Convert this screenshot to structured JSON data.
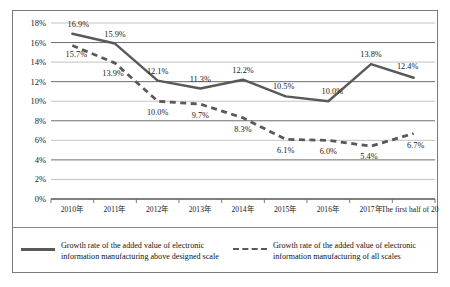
{
  "chart_data": {
    "type": "line",
    "title": "",
    "subtitle": "",
    "xlabel": "",
    "ylabel": "",
    "ylim": [
      0,
      18
    ],
    "ytick_labels": [
      "0%",
      "2%",
      "4%",
      "6%",
      "8%",
      "10%",
      "12%",
      "14%",
      "16%",
      "18%"
    ],
    "ytick_values": [
      0,
      2,
      4,
      6,
      8,
      10,
      12,
      14,
      16,
      18
    ],
    "grid": true,
    "legend_position": "bottom",
    "categories": [
      "2010年",
      "2011年",
      "2012年",
      "2013年",
      "2014年",
      "2015年",
      "2016年",
      "2017年",
      "The first half of 2018"
    ],
    "series": [
      {
        "name": "Growth rate of the added value of electronic information manufacturing above designed scale",
        "style": "solid",
        "color": "#595959",
        "values": [
          16.9,
          15.9,
          12.1,
          11.3,
          12.2,
          10.5,
          10.0,
          13.8,
          12.4
        ],
        "data_labels": [
          "16.9%",
          "15.9%",
          "12.1%",
          "11.3%",
          "12.2%",
          "10.5%",
          "10.0%",
          "13.8%",
          "12.4%"
        ]
      },
      {
        "name": "Growth rate of the added value of electronic information manufacturing of all scales",
        "style": "dashed",
        "color": "#595959",
        "values": [
          15.7,
          13.9,
          10.0,
          9.7,
          8.3,
          6.1,
          6.0,
          5.4,
          6.7
        ],
        "data_labels": [
          "15.7%",
          "13.9%",
          "10.0%",
          "9.7%",
          "8.3%",
          "6.1%",
          "6.0%",
          "5.4%",
          "6.7%"
        ]
      }
    ]
  },
  "legend": {
    "entries": [
      {
        "line1": "Growth rate of the added value of electronic",
        "line2": "information manufacturing above designed scale"
      },
      {
        "line1": "Growth rate of the added value of electronic",
        "line2": "information manufacturing of all scales"
      }
    ]
  }
}
